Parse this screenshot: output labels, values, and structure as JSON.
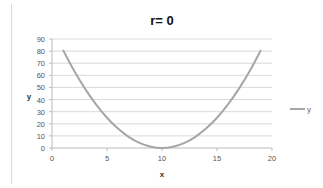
{
  "chart_data": {
    "type": "line",
    "title": "r= 0",
    "xlabel": "x",
    "ylabel": "y",
    "xlim": [
      0,
      20
    ],
    "ylim": [
      0,
      90
    ],
    "x_ticks": [
      0,
      5,
      10,
      15,
      20
    ],
    "y_ticks": [
      0,
      10,
      20,
      30,
      40,
      50,
      60,
      70,
      80,
      90
    ],
    "grid": {
      "horizontal": true,
      "vertical": false
    },
    "legend_position": "right",
    "series": [
      {
        "name": "y",
        "color": "#a6a6a6",
        "x": [
          1,
          2,
          3,
          4,
          5,
          6,
          7,
          8,
          9,
          10,
          11,
          12,
          13,
          14,
          15,
          16,
          17,
          18,
          19
        ],
        "values": [
          81,
          64,
          49,
          36,
          25,
          16,
          9,
          4,
          1,
          0,
          1,
          4,
          9,
          16,
          25,
          36,
          49,
          64,
          81
        ]
      }
    ]
  }
}
